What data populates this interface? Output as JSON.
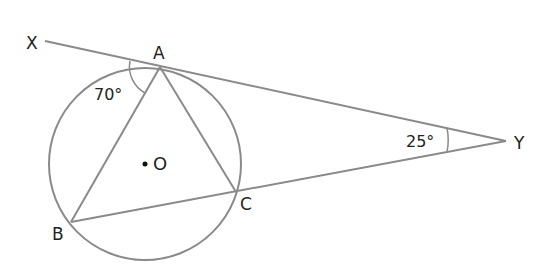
{
  "diagram": {
    "type": "circle-geometry",
    "colors": {
      "line": "#8a8a8a",
      "text": "#222222",
      "background": "#ffffff"
    },
    "circle": {
      "center_label": "O",
      "cx": 145,
      "cy": 164,
      "r": 96
    },
    "points": {
      "X": {
        "label": "X",
        "x": 45,
        "y": 41
      },
      "A": {
        "label": "A",
        "x": 160,
        "y": 67
      },
      "B": {
        "label": "B",
        "x": 71,
        "y": 222
      },
      "C": {
        "label": "C",
        "x": 236,
        "y": 192
      },
      "Y": {
        "label": "Y",
        "x": 506,
        "y": 141
      }
    },
    "angles": {
      "XAB": {
        "label": "70°"
      },
      "AYC": {
        "label": "25°"
      }
    }
  }
}
